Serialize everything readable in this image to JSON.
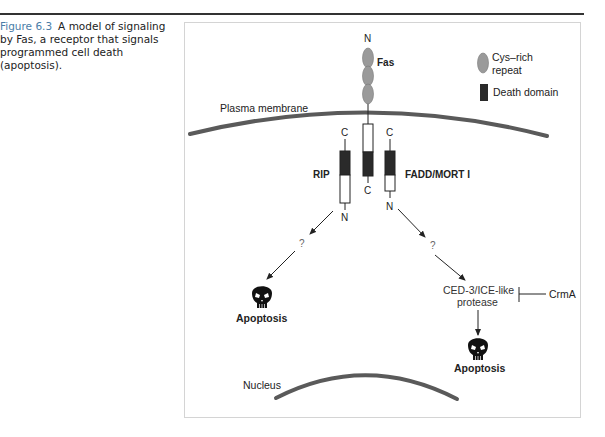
{
  "caption": {
    "figure_number": "Figure 6.3",
    "text": "A model of signaling by Fas, a receptor that signals programmed cell death (apoptosis)."
  },
  "legend": {
    "cys_rich_line1": "Cys–rich",
    "cys_rich_line2": "repeat",
    "death_domain": "Death domain"
  },
  "labels": {
    "plasma_membrane": "Plasma membrane",
    "nucleus": "Nucleus",
    "fas": "Fas",
    "fas_n": "N",
    "fas_c": "C",
    "rip": "RIP",
    "rip_c": "C",
    "rip_n": "N",
    "fadd": "FADD/MORT I",
    "fadd_c": "C",
    "fadd_n": "N",
    "question_left": "?",
    "question_right": "?",
    "apoptosis_left": "Apoptosis",
    "apoptosis_right": "Apoptosis",
    "protease_line1": "CED-3/ICE-like",
    "protease_line2": "protease",
    "crma": "CrmA"
  },
  "colors": {
    "membrane": "#5a5a5a",
    "death_domain": "#2a2a2a",
    "cys_repeat": "#9a9a9a",
    "caption_accent": "#4a7da8",
    "box_border": "#d4d4d4"
  }
}
